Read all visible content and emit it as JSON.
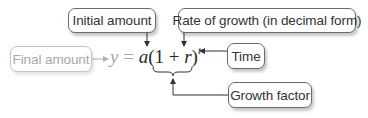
{
  "diagram": {
    "labels": {
      "initial_amount": "Initial amount",
      "rate_of_growth": "Rate of growth (in decimal form)",
      "final_amount": "Final amount",
      "time": "Time",
      "growth_factor": "Growth factor"
    },
    "equation": {
      "y": "y",
      "equals": " = ",
      "a": "a",
      "open": "(1 + ",
      "r": "r",
      "close": ")",
      "t": "t"
    },
    "colors": {
      "line": "#333333",
      "faded_line": "#b0b0b0",
      "box_border": "#6a6a6a",
      "faded_text": "#a8a8a8"
    }
  }
}
